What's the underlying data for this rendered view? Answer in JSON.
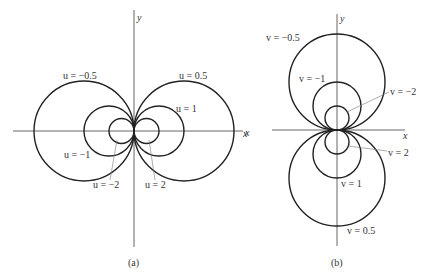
{
  "figure_a": {
    "caption": "(a)",
    "x_axis_label": "x",
    "y_axis_label": "y",
    "curves": [
      {
        "label": "u = −0.5",
        "value": -0.5
      },
      {
        "label": "u = 0.5",
        "value": 0.5
      },
      {
        "label": "u = 1",
        "value": 1
      },
      {
        "label": "u = −1",
        "value": -1
      },
      {
        "label": "u = −2",
        "value": -2
      },
      {
        "label": "u = 2",
        "value": 2
      }
    ]
  },
  "figure_b": {
    "caption": "(b)",
    "x_axis_label": "x",
    "y_axis_label": "y",
    "curves": [
      {
        "label": "v = −0.5",
        "value": -0.5
      },
      {
        "label": "v = −1",
        "value": -1
      },
      {
        "label": "v = −2",
        "value": -2
      },
      {
        "label": "v = 2",
        "value": 2
      },
      {
        "label": "v = 1",
        "value": 1
      },
      {
        "label": "v = 0.5",
        "value": 0.5
      }
    ]
  }
}
